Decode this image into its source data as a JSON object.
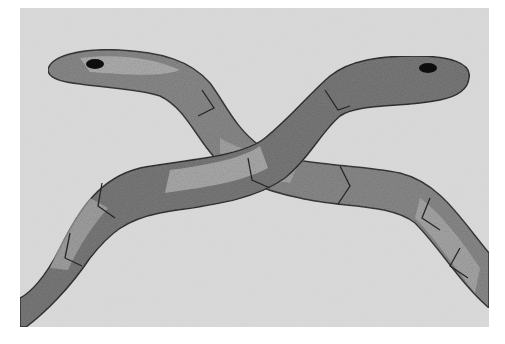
{
  "image": {
    "description": "Grayscale photograph of two embroidered snakes crossing each other",
    "background_color": "#d6d6d6",
    "page_color": "#ffffff"
  },
  "snakes": [
    {
      "name": "left-head-snake",
      "body_color": "#8a8a8a",
      "light_color": "#b8b8b8",
      "outline_color": "#3a3a3a",
      "eye_color": "#111111"
    },
    {
      "name": "right-head-snake",
      "body_color": "#6e6e6e",
      "light_color": "#a4a4a4",
      "outline_color": "#333333",
      "eye_color": "#111111"
    }
  ]
}
